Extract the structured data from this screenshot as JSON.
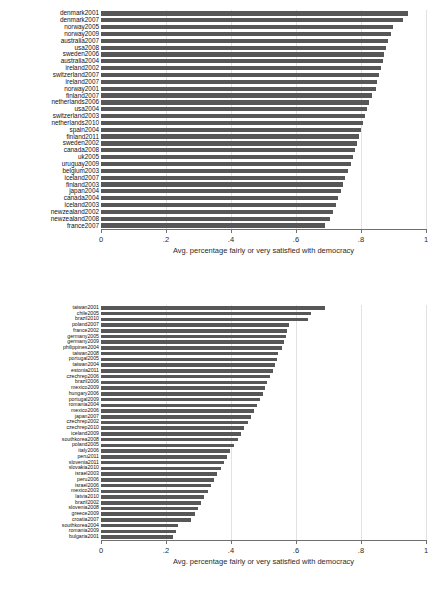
{
  "chart_data": [
    {
      "type": "bar",
      "orientation": "horizontal",
      "title": "",
      "xlabel": "Avg. percentage fairly or very satisfied with democracy",
      "ylabel": "",
      "xlim": [
        0,
        1
      ],
      "xticks": [
        0,
        0.2,
        0.4,
        0.6,
        0.8,
        1
      ],
      "xticklabels": [
        "0",
        ".2",
        ".4",
        ".6",
        ".8",
        "1"
      ],
      "grid": true,
      "bar_color": "#575757",
      "categories": [
        "denmark2001",
        "denmark2007",
        "norway2005",
        "norway2009",
        "australia2007",
        "usa2008",
        "sweden2006",
        "australia2004",
        "ireland2002",
        "switzerland2007",
        "ireland2007",
        "norway2001",
        "finland2007",
        "netherlands2006",
        "usa2004",
        "switzerland2003",
        "netherlands2010",
        "spain2004",
        "finland2011",
        "sweden2002",
        "canada2008",
        "uk2005",
        "uruguay2009",
        "belgium2003",
        "iceland2007",
        "finland2003",
        "japan2004",
        "canada2004",
        "iceland2003",
        "newzealand2002",
        "newzealand2008",
        "france2007"
      ],
      "values": [
        0.945,
        0.93,
        0.898,
        0.893,
        0.884,
        0.876,
        0.872,
        0.868,
        0.862,
        0.856,
        0.85,
        0.845,
        0.833,
        0.824,
        0.818,
        0.812,
        0.806,
        0.8,
        0.793,
        0.787,
        0.781,
        0.775,
        0.768,
        0.76,
        0.752,
        0.745,
        0.738,
        0.73,
        0.722,
        0.714,
        0.704,
        0.69
      ]
    },
    {
      "type": "bar",
      "orientation": "horizontal",
      "title": "",
      "xlabel": "Avg. percentage fairly or very satisfied with democracy",
      "ylabel": "",
      "xlim": [
        0,
        1
      ],
      "xticks": [
        0,
        0.2,
        0.4,
        0.6,
        0.8,
        1
      ],
      "xticklabels": [
        "0",
        ".2",
        ".4",
        ".6",
        ".8",
        "1"
      ],
      "grid": true,
      "bar_color": "#575757",
      "categories": [
        "taiwan2001",
        "chile2005",
        "brazil2010",
        "poland2007",
        "france2002",
        "germany2005",
        "germany2009",
        "philippines2004",
        "taiwan2008",
        "portugal2005",
        "taiwan2004",
        "estonia2011",
        "czechrep2006",
        "brazil2006",
        "mexico2009",
        "hungary2006",
        "portugal2009",
        "romania2004",
        "mexico2006",
        "japan2007",
        "czechrep2002",
        "czechrep2010",
        "iceland2009",
        "southkorea2008",
        "poland2005",
        "italy2006",
        "peru2011",
        "slovenia2011",
        "slovakia2010",
        "israel2003",
        "peru2006",
        "israel2006",
        "mexico2003",
        "latvia2010",
        "brazil2002",
        "slovenia2008",
        "greece2009",
        "croatia2007",
        "southkorea2004",
        "romania2009",
        "bulgaria2001"
      ],
      "values": [
        0.69,
        0.647,
        0.637,
        0.578,
        0.573,
        0.568,
        0.563,
        0.556,
        0.545,
        0.54,
        0.535,
        0.53,
        0.52,
        0.512,
        0.505,
        0.498,
        0.49,
        0.48,
        0.47,
        0.462,
        0.452,
        0.44,
        0.43,
        0.42,
        0.408,
        0.398,
        0.388,
        0.378,
        0.368,
        0.358,
        0.348,
        0.338,
        0.328,
        0.318,
        0.308,
        0.298,
        0.288,
        0.278,
        0.238,
        0.232,
        0.22
      ]
    }
  ]
}
